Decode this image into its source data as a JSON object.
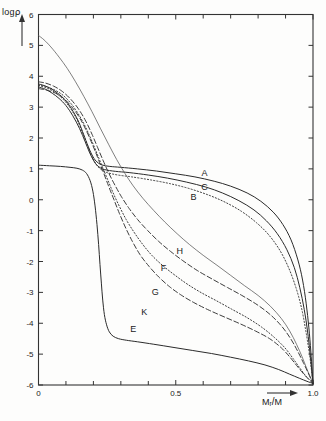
{
  "chart_data": {
    "type": "line",
    "title": "",
    "xlabel": "M_r/M",
    "ylabel": "log ρ",
    "xlim": [
      0,
      1.0
    ],
    "ylim": [
      -6,
      6
    ],
    "grid": false,
    "legend_position": "inline-labels",
    "x_ticks_major": [
      0,
      0.5,
      1.0
    ],
    "x_ticklabels": [
      "0",
      "0.5",
      "1.0"
    ],
    "x_ticks_minor": [
      0.1,
      0.2,
      0.3,
      0.4,
      0.6,
      0.7,
      0.8,
      0.9
    ],
    "y_ticks": [
      6,
      5,
      4,
      3,
      2,
      1,
      0,
      -1,
      -2,
      -3,
      -4,
      -5,
      -6
    ],
    "y_ticklabels": [
      "6",
      "5",
      "4",
      "3",
      "2",
      "1",
      "0",
      "-1",
      "-2",
      "-3",
      "-4",
      "-5",
      "-6"
    ],
    "series": [
      {
        "name": "A",
        "style": "solid",
        "label_x": 0.605,
        "label_y": 0.78,
        "points": [
          [
            0.0,
            3.75
          ],
          [
            0.02,
            3.7
          ],
          [
            0.045,
            3.6
          ],
          [
            0.07,
            3.45
          ],
          [
            0.095,
            3.25
          ],
          [
            0.12,
            2.95
          ],
          [
            0.145,
            2.55
          ],
          [
            0.165,
            2.1
          ],
          [
            0.18,
            1.75
          ],
          [
            0.195,
            1.45
          ],
          [
            0.21,
            1.25
          ],
          [
            0.23,
            1.13
          ],
          [
            0.26,
            1.08
          ],
          [
            0.3,
            1.05
          ],
          [
            0.36,
            1.0
          ],
          [
            0.43,
            0.93
          ],
          [
            0.5,
            0.84
          ],
          [
            0.57,
            0.74
          ],
          [
            0.64,
            0.6
          ],
          [
            0.7,
            0.44
          ],
          [
            0.76,
            0.22
          ],
          [
            0.81,
            -0.05
          ],
          [
            0.855,
            -0.4
          ],
          [
            0.89,
            -0.8
          ],
          [
            0.92,
            -1.3
          ],
          [
            0.945,
            -1.95
          ],
          [
            0.962,
            -2.6
          ],
          [
            0.975,
            -3.35
          ],
          [
            0.985,
            -4.15
          ],
          [
            0.992,
            -4.9
          ],
          [
            0.997,
            -5.55
          ],
          [
            1.0,
            -5.95
          ]
        ]
      },
      {
        "name": "C",
        "style": "solid",
        "label_x": 0.605,
        "label_y": 0.33,
        "points": [
          [
            0.0,
            3.65
          ],
          [
            0.025,
            3.58
          ],
          [
            0.05,
            3.45
          ],
          [
            0.075,
            3.28
          ],
          [
            0.1,
            3.05
          ],
          [
            0.125,
            2.72
          ],
          [
            0.15,
            2.3
          ],
          [
            0.17,
            1.88
          ],
          [
            0.185,
            1.55
          ],
          [
            0.2,
            1.28
          ],
          [
            0.215,
            1.1
          ],
          [
            0.24,
            0.98
          ],
          [
            0.28,
            0.92
          ],
          [
            0.33,
            0.88
          ],
          [
            0.4,
            0.8
          ],
          [
            0.47,
            0.7
          ],
          [
            0.54,
            0.57
          ],
          [
            0.61,
            0.41
          ],
          [
            0.67,
            0.22
          ],
          [
            0.73,
            -0.03
          ],
          [
            0.785,
            -0.33
          ],
          [
            0.83,
            -0.68
          ],
          [
            0.87,
            -1.1
          ],
          [
            0.905,
            -1.62
          ],
          [
            0.932,
            -2.2
          ],
          [
            0.952,
            -2.85
          ],
          [
            0.968,
            -3.55
          ],
          [
            0.98,
            -4.25
          ],
          [
            0.989,
            -4.95
          ],
          [
            0.995,
            -5.5
          ],
          [
            1.0,
            -5.95
          ]
        ]
      },
      {
        "name": "B",
        "style": "dotted",
        "label_x": 0.565,
        "label_y": -0.02,
        "points": [
          [
            0.0,
            3.7
          ],
          [
            0.03,
            3.62
          ],
          [
            0.06,
            3.48
          ],
          [
            0.09,
            3.25
          ],
          [
            0.115,
            2.98
          ],
          [
            0.14,
            2.6
          ],
          [
            0.16,
            2.18
          ],
          [
            0.178,
            1.78
          ],
          [
            0.192,
            1.45
          ],
          [
            0.208,
            1.18
          ],
          [
            0.225,
            1.0
          ],
          [
            0.25,
            0.88
          ],
          [
            0.29,
            0.8
          ],
          [
            0.34,
            0.74
          ],
          [
            0.41,
            0.64
          ],
          [
            0.48,
            0.52
          ],
          [
            0.55,
            0.36
          ],
          [
            0.62,
            0.15
          ],
          [
            0.68,
            -0.08
          ],
          [
            0.74,
            -0.38
          ],
          [
            0.795,
            -0.75
          ],
          [
            0.84,
            -1.15
          ],
          [
            0.88,
            -1.65
          ],
          [
            0.912,
            -2.22
          ],
          [
            0.938,
            -2.85
          ],
          [
            0.958,
            -3.5
          ],
          [
            0.972,
            -4.15
          ],
          [
            0.983,
            -4.75
          ],
          [
            0.991,
            -5.25
          ],
          [
            0.996,
            -5.65
          ],
          [
            1.0,
            -5.95
          ]
        ]
      },
      {
        "name": "H",
        "style": "thin-solid",
        "label_x": 0.515,
        "label_y": -1.77,
        "points": [
          [
            0.0,
            5.32
          ],
          [
            0.02,
            5.18
          ],
          [
            0.045,
            4.95
          ],
          [
            0.075,
            4.62
          ],
          [
            0.105,
            4.25
          ],
          [
            0.135,
            3.82
          ],
          [
            0.165,
            3.35
          ],
          [
            0.195,
            2.85
          ],
          [
            0.225,
            2.32
          ],
          [
            0.255,
            1.8
          ],
          [
            0.285,
            1.3
          ],
          [
            0.315,
            0.85
          ],
          [
            0.345,
            0.45
          ],
          [
            0.38,
            0.05
          ],
          [
            0.42,
            -0.35
          ],
          [
            0.46,
            -0.72
          ],
          [
            0.505,
            -1.1
          ],
          [
            0.55,
            -1.45
          ],
          [
            0.6,
            -1.8
          ],
          [
            0.65,
            -2.12
          ],
          [
            0.7,
            -2.45
          ],
          [
            0.75,
            -2.78
          ],
          [
            0.8,
            -3.1
          ],
          [
            0.845,
            -3.45
          ],
          [
            0.885,
            -3.85
          ],
          [
            0.915,
            -4.25
          ],
          [
            0.94,
            -4.68
          ],
          [
            0.96,
            -5.08
          ],
          [
            0.975,
            -5.42
          ],
          [
            0.988,
            -5.7
          ],
          [
            1.0,
            -5.95
          ]
        ]
      },
      {
        "name": "F",
        "style": "dashed",
        "label_x": 0.455,
        "label_y": -2.32,
        "points": [
          [
            0.0,
            3.82
          ],
          [
            0.025,
            3.78
          ],
          [
            0.055,
            3.68
          ],
          [
            0.085,
            3.52
          ],
          [
            0.115,
            3.28
          ],
          [
            0.145,
            2.95
          ],
          [
            0.172,
            2.55
          ],
          [
            0.195,
            2.12
          ],
          [
            0.215,
            1.7
          ],
          [
            0.235,
            1.28
          ],
          [
            0.255,
            0.88
          ],
          [
            0.278,
            0.48
          ],
          [
            0.302,
            0.1
          ],
          [
            0.33,
            -0.28
          ],
          [
            0.362,
            -0.65
          ],
          [
            0.398,
            -1.0
          ],
          [
            0.438,
            -1.35
          ],
          [
            0.482,
            -1.68
          ],
          [
            0.53,
            -2.0
          ],
          [
            0.58,
            -2.3
          ],
          [
            0.635,
            -2.58
          ],
          [
            0.69,
            -2.85
          ],
          [
            0.745,
            -3.12
          ],
          [
            0.8,
            -3.42
          ],
          [
            0.848,
            -3.75
          ],
          [
            0.888,
            -4.12
          ],
          [
            0.92,
            -4.52
          ],
          [
            0.945,
            -4.92
          ],
          [
            0.965,
            -5.28
          ],
          [
            0.982,
            -5.6
          ],
          [
            1.0,
            -5.95
          ]
        ]
      },
      {
        "name": "G",
        "style": "dotted",
        "label_x": 0.425,
        "label_y": -3.08,
        "points": [
          [
            0.0,
            3.72
          ],
          [
            0.03,
            3.66
          ],
          [
            0.06,
            3.55
          ],
          [
            0.09,
            3.38
          ],
          [
            0.118,
            3.12
          ],
          [
            0.145,
            2.78
          ],
          [
            0.17,
            2.38
          ],
          [
            0.192,
            1.95
          ],
          [
            0.212,
            1.52
          ],
          [
            0.232,
            1.08
          ],
          [
            0.252,
            0.65
          ],
          [
            0.272,
            0.22
          ],
          [
            0.295,
            -0.22
          ],
          [
            0.32,
            -0.65
          ],
          [
            0.348,
            -1.05
          ],
          [
            0.38,
            -1.45
          ],
          [
            0.415,
            -1.82
          ],
          [
            0.455,
            -2.15
          ],
          [
            0.498,
            -2.45
          ],
          [
            0.545,
            -2.75
          ],
          [
            0.595,
            -3.02
          ],
          [
            0.65,
            -3.28
          ],
          [
            0.705,
            -3.55
          ],
          [
            0.76,
            -3.82
          ],
          [
            0.812,
            -4.12
          ],
          [
            0.858,
            -4.45
          ],
          [
            0.898,
            -4.8
          ],
          [
            0.928,
            -5.15
          ],
          [
            0.952,
            -5.45
          ],
          [
            0.975,
            -5.72
          ],
          [
            1.0,
            -5.95
          ]
        ]
      },
      {
        "name": "K",
        "style": "dashed",
        "label_x": 0.385,
        "label_y": -3.72,
        "points": [
          [
            0.0,
            3.6
          ],
          [
            0.03,
            3.55
          ],
          [
            0.062,
            3.45
          ],
          [
            0.092,
            3.28
          ],
          [
            0.12,
            3.02
          ],
          [
            0.148,
            2.68
          ],
          [
            0.172,
            2.28
          ],
          [
            0.195,
            1.82
          ],
          [
            0.215,
            1.38
          ],
          [
            0.235,
            0.92
          ],
          [
            0.255,
            0.45
          ],
          [
            0.275,
            0.0
          ],
          [
            0.295,
            -0.45
          ],
          [
            0.318,
            -0.92
          ],
          [
            0.342,
            -1.35
          ],
          [
            0.37,
            -1.78
          ],
          [
            0.402,
            -2.15
          ],
          [
            0.438,
            -2.5
          ],
          [
            0.478,
            -2.82
          ],
          [
            0.522,
            -3.1
          ],
          [
            0.57,
            -3.35
          ],
          [
            0.622,
            -3.58
          ],
          [
            0.678,
            -3.8
          ],
          [
            0.735,
            -4.02
          ],
          [
            0.79,
            -4.25
          ],
          [
            0.842,
            -4.5
          ],
          [
            0.885,
            -4.8
          ],
          [
            0.918,
            -5.12
          ],
          [
            0.945,
            -5.42
          ],
          [
            0.972,
            -5.7
          ],
          [
            1.0,
            -5.95
          ]
        ]
      },
      {
        "name": "E",
        "style": "solid",
        "label_x": 0.345,
        "label_y": -4.28,
        "points": [
          [
            0.0,
            1.12
          ],
          [
            0.04,
            1.1
          ],
          [
            0.08,
            1.08
          ],
          [
            0.115,
            1.05
          ],
          [
            0.14,
            1.02
          ],
          [
            0.16,
            0.96
          ],
          [
            0.175,
            0.85
          ],
          [
            0.188,
            0.62
          ],
          [
            0.198,
            0.28
          ],
          [
            0.206,
            -0.2
          ],
          [
            0.213,
            -0.8
          ],
          [
            0.219,
            -1.45
          ],
          [
            0.224,
            -2.1
          ],
          [
            0.229,
            -2.7
          ],
          [
            0.234,
            -3.25
          ],
          [
            0.24,
            -3.72
          ],
          [
            0.248,
            -4.05
          ],
          [
            0.258,
            -4.28
          ],
          [
            0.272,
            -4.42
          ],
          [
            0.292,
            -4.5
          ],
          [
            0.32,
            -4.55
          ],
          [
            0.36,
            -4.6
          ],
          [
            0.42,
            -4.68
          ],
          [
            0.49,
            -4.78
          ],
          [
            0.56,
            -4.88
          ],
          [
            0.63,
            -4.98
          ],
          [
            0.7,
            -5.1
          ],
          [
            0.765,
            -5.22
          ],
          [
            0.825,
            -5.35
          ],
          [
            0.875,
            -5.5
          ],
          [
            0.915,
            -5.65
          ],
          [
            0.95,
            -5.78
          ],
          [
            0.978,
            -5.88
          ],
          [
            1.0,
            -5.95
          ]
        ]
      }
    ]
  },
  "axes": {
    "y_axis_label": "log ρ",
    "y_axis_label_base": "log",
    "y_axis_label_rho": "ρ",
    "x_axis_label_m": "M",
    "x_axis_label_sub": "r",
    "x_axis_label_denom": "M"
  }
}
